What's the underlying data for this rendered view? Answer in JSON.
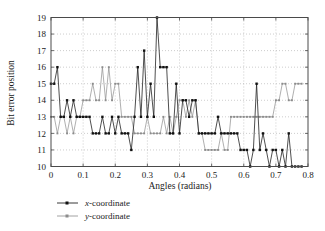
{
  "chart_data": {
    "type": "line",
    "title": "",
    "xlabel": "Angles (radians)",
    "ylabel": "Bit error position",
    "xlim": [
      0,
      0.8
    ],
    "ylim": [
      10,
      19
    ],
    "xticks": [
      "0",
      "0.1",
      "0.2",
      "0.3",
      "0.4",
      "0.5",
      "0.6",
      "0.7",
      "0.8"
    ],
    "xtick_values": [
      0,
      0.1,
      0.2,
      0.3,
      0.4,
      0.5,
      0.6,
      0.7,
      0.8
    ],
    "yticks": [
      "10",
      "11",
      "12",
      "13",
      "14",
      "15",
      "16",
      "17",
      "18",
      "19"
    ],
    "ytick_values": [
      10,
      11,
      12,
      13,
      14,
      15,
      16,
      17,
      18,
      19
    ],
    "grid": true,
    "grid_style": "dotted",
    "legend_position": "below-left",
    "x": [
      0.0,
      0.01,
      0.02,
      0.03,
      0.04,
      0.05,
      0.06,
      0.07,
      0.08,
      0.09,
      0.1,
      0.11,
      0.12,
      0.13,
      0.14,
      0.15,
      0.16,
      0.17,
      0.18,
      0.19,
      0.2,
      0.21,
      0.22,
      0.23,
      0.24,
      0.25,
      0.26,
      0.27,
      0.28,
      0.29,
      0.3,
      0.31,
      0.32,
      0.33,
      0.34,
      0.35,
      0.36,
      0.37,
      0.38,
      0.39,
      0.4,
      0.41,
      0.42,
      0.43,
      0.44,
      0.45,
      0.46,
      0.47,
      0.48,
      0.49,
      0.5,
      0.51,
      0.52,
      0.53,
      0.54,
      0.55,
      0.56,
      0.57,
      0.58,
      0.59,
      0.6,
      0.61,
      0.62,
      0.63,
      0.64,
      0.65,
      0.66,
      0.67,
      0.68,
      0.69,
      0.7,
      0.71,
      0.72,
      0.73,
      0.74,
      0.75,
      0.76,
      0.77,
      0.78
    ],
    "series": [
      {
        "name": "x-coordinate",
        "color": "#111111",
        "marker": "square",
        "values": [
          15,
          15,
          16,
          13,
          13,
          14,
          13,
          14,
          13,
          13,
          13,
          13,
          13,
          12,
          12,
          12,
          13,
          12,
          12,
          13,
          12,
          13,
          12,
          12,
          12,
          11,
          13,
          16,
          13,
          17,
          13,
          15,
          13,
          19,
          16,
          16,
          16,
          12,
          12,
          15,
          12,
          14,
          14,
          13,
          14,
          14,
          12,
          12,
          12,
          12,
          12,
          12,
          13,
          12,
          12,
          12,
          12,
          12,
          12,
          11,
          11,
          11,
          10,
          11,
          15,
          11,
          12,
          11,
          10,
          11,
          11,
          10,
          11,
          10,
          12,
          10,
          10,
          10,
          10
        ]
      },
      {
        "name": "y-coordinate",
        "color": "#8c8c8c",
        "marker": "square",
        "values": [
          13,
          13,
          12,
          13,
          13,
          12,
          13,
          12,
          13,
          13,
          14,
          14,
          14,
          15,
          14,
          14,
          16,
          14,
          16,
          14,
          15,
          15,
          13,
          13,
          13,
          13,
          12,
          12,
          12,
          12,
          13,
          12,
          12,
          12,
          12,
          13,
          12,
          13,
          12,
          13,
          14,
          14,
          13,
          14,
          13,
          14,
          12,
          12,
          11,
          11,
          11,
          11,
          11,
          12,
          11,
          11,
          13,
          13,
          13,
          13,
          13,
          13,
          13,
          13,
          13,
          13,
          13,
          13,
          13,
          13,
          14,
          14,
          15,
          15,
          14,
          14,
          15,
          15,
          15
        ]
      }
    ]
  },
  "legend": {
    "items": [
      {
        "label_italic": "x",
        "label_rest": "-coordinate"
      },
      {
        "label_italic": "y",
        "label_rest": "-coordinate"
      }
    ]
  }
}
